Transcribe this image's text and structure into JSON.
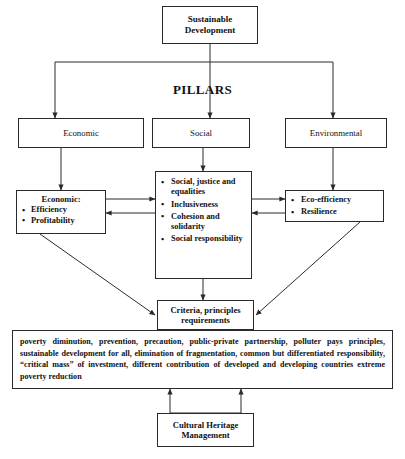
{
  "diagram": {
    "title_box": {
      "line1": "Sustainable",
      "line2": "Development"
    },
    "pillars_label": "PILLARS",
    "pillars": [
      {
        "label": "Economic"
      },
      {
        "label": "Social"
      },
      {
        "label": "Environmental"
      }
    ],
    "economic_detail": {
      "header": "Economic:",
      "bullets": [
        "Efficiency",
        "Profitability"
      ]
    },
    "social_detail": {
      "bullets": [
        "Social, justice and equalities",
        "Inclusiveness",
        "Cohesion and solidarity",
        "Social responsibility"
      ]
    },
    "environmental_detail": {
      "bullets": [
        "Eco-efficiency",
        "Resilience"
      ]
    },
    "criteria_box": {
      "line1": "Criteria, principles",
      "line2": "requirements"
    },
    "principles_text": "poverty diminution, prevention, precaution, public-private partnership, polluter pays principles, sustainable development for all, elimination of fragmentation, common but differentiated responsibility, “critical mass” of investment, different contribution of developed and developing countries extreme poverty reduction",
    "cultural_heritage_box": {
      "line1": "Cultural Heritage",
      "line2": "Management"
    },
    "colors": {
      "line": "#2a2a2a",
      "text": "#111111",
      "background": "#ffffff"
    }
  }
}
